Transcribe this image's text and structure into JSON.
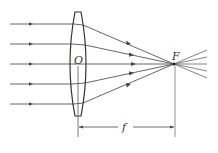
{
  "diagram": {
    "labels": {
      "optical_center": "O",
      "focal_point": "F",
      "focal_length": "f"
    },
    "colors": {
      "line": "#444444",
      "background": "#ffffff"
    },
    "lens": {
      "type": "convex",
      "center_x": 78,
      "top_y": 12,
      "bottom_y": 116
    },
    "rays": [
      {
        "y": 24
      },
      {
        "y": 44
      },
      {
        "y": 64
      },
      {
        "y": 84
      },
      {
        "y": 104
      }
    ],
    "focal_point": {
      "x": 174,
      "y": 64
    }
  }
}
